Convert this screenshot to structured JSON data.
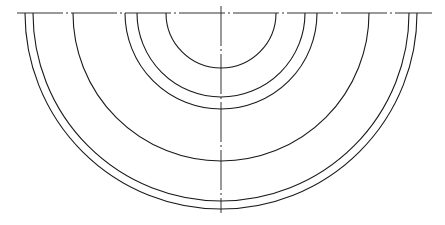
{
  "diagram": {
    "type": "concentric-semicircles",
    "center": {
      "x": 221,
      "y": 13
    },
    "centerline_horizontal": {
      "x1": 17,
      "x2": 432,
      "y": 13
    },
    "centerline_vertical": {
      "x": 221,
      "y1": 6,
      "y2": 213
    },
    "radii": [
      55,
      84,
      96,
      148,
      188,
      196
    ],
    "stroke_color": "#1a1a1a",
    "background": "#ffffff"
  }
}
